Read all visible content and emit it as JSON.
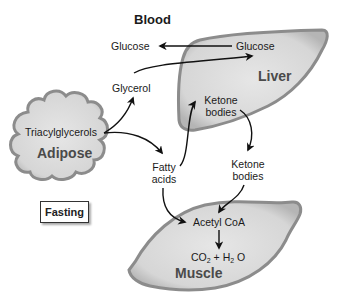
{
  "diagram": {
    "title": "Blood",
    "state_label": "Fasting",
    "organs": {
      "adipose": {
        "label": "Adipose",
        "metabolite": "Triacylglycerols"
      },
      "liver": {
        "label": "Liver",
        "metabolites": [
          "Glucose",
          "Ketone",
          "bodies"
        ]
      },
      "muscle": {
        "label": "Muscle",
        "metabolites": [
          "Acetyl CoA"
        ]
      }
    },
    "blood_metabolites": {
      "glucose": "Glucose",
      "glycerol": "Glycerol",
      "fatty_acids_line1": "Fatty",
      "fatty_acids_line2": "acids",
      "ketone_line1": "Ketone",
      "ketone_line2": "bodies"
    },
    "products": {
      "co": "CO",
      "co_sub": "2",
      "plus": " + ",
      "h": "H",
      "h_sub": "2",
      "o": " O"
    },
    "flows": [
      {
        "from": "Liver Glucose",
        "to": "Blood Glucose"
      },
      {
        "from": "Triacylglycerols",
        "to": "Glycerol"
      },
      {
        "from": "Glycerol",
        "to": "Liver Glucose"
      },
      {
        "from": "Triacylglycerols",
        "to": "Fatty acids"
      },
      {
        "from": "Fatty acids",
        "to": "Liver Ketone bodies"
      },
      {
        "from": "Liver Ketone bodies",
        "to": "Blood Ketone bodies"
      },
      {
        "from": "Fatty acids",
        "to": "Acetyl CoA"
      },
      {
        "from": "Blood Ketone bodies",
        "to": "Acetyl CoA"
      },
      {
        "from": "Acetyl CoA",
        "to": "CO2 + H2O"
      }
    ],
    "colors": {
      "organ_fill": "#d9d9d9",
      "organ_edge": "#8c8c8c",
      "arrow": "#111111",
      "organ_label": "#4a4a4a"
    }
  }
}
